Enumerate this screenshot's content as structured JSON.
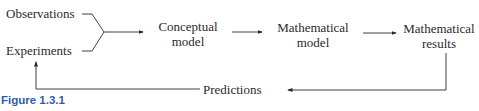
{
  "diagram": {
    "inputs": [
      "Observations",
      "Experiments"
    ],
    "nodes": [
      {
        "id": "conceptual",
        "lines": [
          "Conceptual",
          "model"
        ]
      },
      {
        "id": "mathematical-model",
        "lines": [
          "Mathematical",
          "model"
        ]
      },
      {
        "id": "mathematical-results",
        "lines": [
          "Mathematical",
          "results"
        ]
      }
    ],
    "feedback_label": "Predictions",
    "edges": [
      {
        "from": "Observations",
        "to": "Conceptual model"
      },
      {
        "from": "Experiments",
        "to": "Conceptual model"
      },
      {
        "from": "Conceptual model",
        "to": "Mathematical model"
      },
      {
        "from": "Mathematical model",
        "to": "Mathematical results"
      },
      {
        "from": "Mathematical results",
        "to": "Predictions"
      },
      {
        "from": "Predictions",
        "to": "Experiments"
      }
    ]
  },
  "caption": "Figure 1.3.1",
  "colors": {
    "caption": "#2e5fa3",
    "ink": "#2a2a2a"
  }
}
